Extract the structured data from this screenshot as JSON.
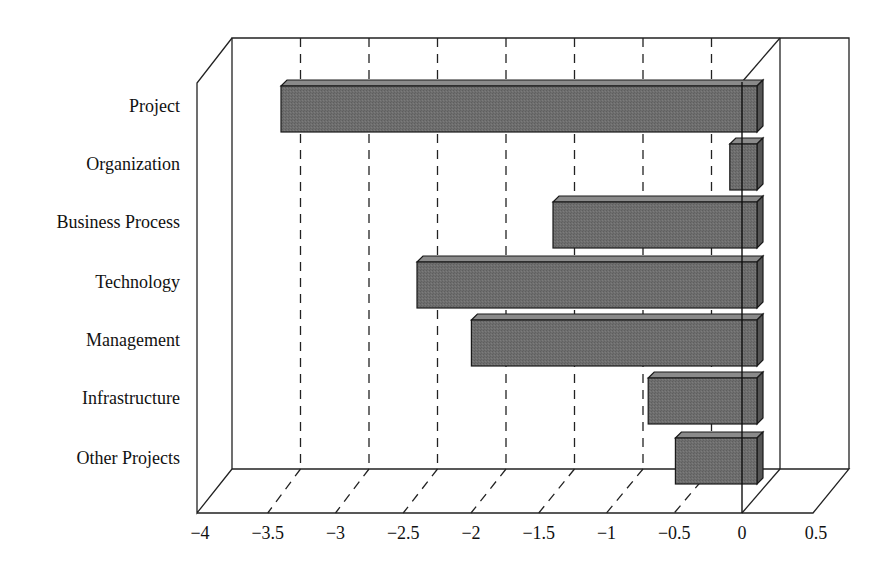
{
  "chart_data": {
    "type": "bar",
    "orientation": "horizontal",
    "style": "3d",
    "title": "",
    "xlabel": "",
    "ylabel": "",
    "categories": [
      "Project",
      "Organization",
      "Business Process",
      "Technology",
      "Management",
      "Infrastructure",
      "Other Projects"
    ],
    "values": [
      -3.5,
      -0.2,
      -1.5,
      -2.5,
      -2.1,
      -0.8,
      -0.6
    ],
    "xlim": [
      -4,
      0.5
    ],
    "x_ticks": [
      -4,
      -3.5,
      -3,
      -2.5,
      -2,
      -1.5,
      -1,
      -0.5,
      0,
      0.5
    ],
    "x_tick_labels": [
      "−4",
      "−3.5",
      "−3",
      "−2.5",
      "−2",
      "−1.5",
      "−1",
      "−0.5",
      "0",
      "0.5"
    ],
    "grid": "dashed vertical",
    "legend": null,
    "bar_color": "#6b6b6b",
    "bar_top_color": "#8a8a8a",
    "bar_side_color": "#555555"
  }
}
